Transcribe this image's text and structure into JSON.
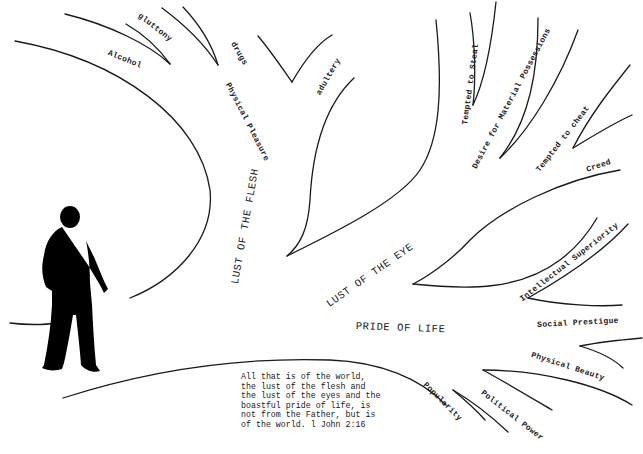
{
  "diagram": {
    "main_branches": [
      {
        "id": "flesh",
        "label": "LUST OF THE FLESH"
      },
      {
        "id": "eye",
        "label": "LUST OF THE EYE"
      },
      {
        "id": "life",
        "label": "PRIDE OF LIFE"
      }
    ],
    "flesh_branches": [
      {
        "label": "Alcohol"
      },
      {
        "label": "gluttony"
      },
      {
        "label": "drugs"
      },
      {
        "label": "Physical Pleasure"
      },
      {
        "label": "adultery"
      }
    ],
    "eye_branches": [
      {
        "label": "Tempted to Steal"
      },
      {
        "label": "Desire for Material Possessions"
      },
      {
        "label": "Tempted to cheat"
      },
      {
        "label": "Creed"
      }
    ],
    "life_branches": [
      {
        "label": "Intellectual Superiority"
      },
      {
        "label": "Social Prestigue"
      },
      {
        "label": "Physical Beauty"
      },
      {
        "label": "Political Power"
      },
      {
        "label": "Popularity"
      }
    ],
    "verse": {
      "lines": [
        "All that is of the world,",
        "the lust of the flesh and",
        "the lust of the eyes and the",
        "boastful pride of life, is",
        "not from the Father, but is",
        "of the world.  l John 2:16"
      ]
    },
    "figure": {
      "description": "walking-man-silhouette"
    }
  }
}
